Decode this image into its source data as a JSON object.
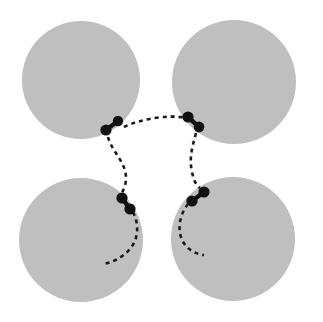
{
  "figure": {
    "width": 323,
    "height": 322,
    "background_color": "#ffffff",
    "disk_color": "#bfbfbf",
    "particle_color": "#111111",
    "trajectory_color": "#1a1a1a",
    "trajectory_dash": "4 4",
    "trajectory_width": 2.6
  },
  "disks": [
    {
      "name": "disk-top-left",
      "cx": 81,
      "cy": 80,
      "r": 59
    },
    {
      "name": "disk-top-right",
      "cx": 234,
      "cy": 82,
      "r": 62
    },
    {
      "name": "disk-bottom-left",
      "cx": 81,
      "cy": 240,
      "r": 62
    },
    {
      "name": "disk-bottom-right",
      "cx": 233,
      "cy": 239,
      "r": 62
    }
  ],
  "dimers": [
    {
      "name": "dimer-top-left",
      "dot_a": {
        "cx": 118,
        "cy": 121,
        "r": 5.2
      },
      "dot_b": {
        "cx": 106,
        "cy": 130,
        "r": 5.6
      },
      "rod_width": 4.4
    },
    {
      "name": "dimer-top-right",
      "dot_a": {
        "cx": 188,
        "cy": 117,
        "r": 5.6
      },
      "dot_b": {
        "cx": 199,
        "cy": 127,
        "r": 5.4
      },
      "rod_width": 4.4
    },
    {
      "name": "dimer-bottom-left",
      "dot_a": {
        "cx": 122,
        "cy": 198,
        "r": 5.6
      },
      "dot_b": {
        "cx": 130,
        "cy": 209,
        "r": 5.6
      },
      "rod_width": 4.4
    },
    {
      "name": "dimer-bottom-right",
      "dot_a": {
        "cx": 204,
        "cy": 192,
        "r": 5.6
      },
      "dot_b": {
        "cx": 192,
        "cy": 201,
        "r": 5.6
      },
      "rod_width": 4.4
    }
  ],
  "trajectories": [
    {
      "name": "trajectory-top-bridge",
      "d": "M 124,127 C 140,119 170,114 186,118"
    },
    {
      "name": "trajectory-left-vertical",
      "d": "M 108,137 C 112,152 126,162 126,178 C 126,186 123,190 122,193"
    },
    {
      "name": "trajectory-right-vertical",
      "d": "M 196,133 C 192,148 189,158 192,172 C 194,182 197,186 200,188"
    },
    {
      "name": "trajectory-bottom-left-tail",
      "d": "M 133,212 C 139,224 139,238 130,249 C 121,259 112,262 104,264"
    },
    {
      "name": "trajectory-bottom-right-tail",
      "d": "M 188,204 C 180,214 177,228 182,240 C 187,250 196,254 204,255"
    }
  ]
}
